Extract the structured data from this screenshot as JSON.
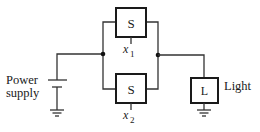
{
  "diagram": {
    "type": "circuit",
    "colors": {
      "line": "#333333",
      "box_border": "#1a1a1a",
      "background": "#ffffff"
    },
    "components": {
      "switch_top": {
        "symbol": "S",
        "variable": "x",
        "subscript": "1"
      },
      "switch_bottom": {
        "symbol": "S",
        "variable": "x",
        "subscript": "2"
      },
      "light": {
        "symbol": "L",
        "label": "Light"
      },
      "power_supply": {
        "label_line1": "Power",
        "label_line2": "supply"
      }
    }
  }
}
